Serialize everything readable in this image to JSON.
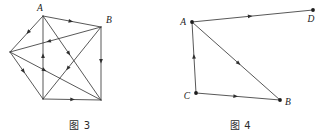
{
  "page": {
    "background_color": "#ffffff",
    "ink_color": "#3a3a3a",
    "node_color": "#1d1d1d"
  },
  "figures": [
    {
      "id": "figure-3",
      "caption": "图 3",
      "description": "complete-graph-on-five-vertices-with-directed-edges",
      "nodes": [
        {
          "id": "A",
          "label": "A",
          "x": 43,
          "y": 16,
          "label_x": 40,
          "label_y": 11,
          "label_anchor": "middle",
          "show_dot": false
        },
        {
          "id": "B",
          "label": "B",
          "x": 101,
          "y": 27,
          "label_x": 106,
          "label_y": 23,
          "label_anchor": "start",
          "show_dot": false
        },
        {
          "id": "L",
          "label": "",
          "x": 10,
          "y": 52,
          "label_x": 6,
          "label_y": 50,
          "label_anchor": "end",
          "show_dot": false
        },
        {
          "id": "P",
          "label": "",
          "x": 43,
          "y": 99,
          "label_x": 40,
          "label_y": 110,
          "label_anchor": "middle",
          "show_dot": false
        },
        {
          "id": "Q",
          "label": "",
          "x": 101,
          "y": 100,
          "label_x": 106,
          "label_y": 108,
          "label_anchor": "start",
          "show_dot": false
        }
      ],
      "edges": [
        {
          "from": "A",
          "to": "B",
          "arrow_at": 0.52,
          "arrow_dir": "forward"
        },
        {
          "from": "A",
          "to": "L",
          "arrow_at": 0.5,
          "arrow_dir": "forward"
        },
        {
          "from": "A",
          "to": "Q",
          "arrow_at": 0.47,
          "arrow_dir": "forward"
        },
        {
          "from": "P",
          "to": "A",
          "arrow_at": 0.55,
          "arrow_dir": "forward"
        },
        {
          "from": "B",
          "to": "L",
          "arrow_at": 0.6,
          "arrow_dir": "forward"
        },
        {
          "from": "B",
          "to": "Q",
          "arrow_at": 0.5,
          "arrow_dir": "forward"
        },
        {
          "from": "B",
          "to": "P",
          "arrow_at": 0.6,
          "arrow_dir": "forward"
        },
        {
          "from": "L",
          "to": "P",
          "arrow_at": 0.45,
          "arrow_dir": "forward"
        },
        {
          "from": "L",
          "to": "Q",
          "arrow_at": 0.4,
          "arrow_dir": "forward"
        },
        {
          "from": "P",
          "to": "Q",
          "arrow_at": 0.55,
          "arrow_dir": "forward"
        }
      ]
    },
    {
      "id": "figure-4",
      "caption": "图 4",
      "description": "four-vertex-directed-graph-A-B-C-D",
      "nodes": [
        {
          "id": "A",
          "label": "A",
          "x": 32,
          "y": 22,
          "label_x": 26,
          "label_y": 25,
          "label_anchor": "end",
          "show_dot": true
        },
        {
          "id": "D",
          "label": "D",
          "x": 153,
          "y": 10,
          "label_x": 151,
          "label_y": 22,
          "label_anchor": "middle",
          "show_dot": true
        },
        {
          "id": "C",
          "label": "C",
          "x": 36,
          "y": 93,
          "label_x": 30,
          "label_y": 99,
          "label_anchor": "end",
          "show_dot": true
        },
        {
          "id": "B",
          "label": "B",
          "x": 120,
          "y": 100,
          "label_x": 125,
          "label_y": 105,
          "label_anchor": "start",
          "show_dot": true
        }
      ],
      "edges": [
        {
          "from": "A",
          "to": "D",
          "arrow_at": 0.5,
          "arrow_dir": "forward"
        },
        {
          "from": "A",
          "to": "B",
          "arrow_at": 0.55,
          "arrow_dir": "forward"
        },
        {
          "from": "C",
          "to": "A",
          "arrow_at": 0.55,
          "arrow_dir": "forward"
        },
        {
          "from": "C",
          "to": "B",
          "arrow_at": 0.5,
          "arrow_dir": "forward"
        }
      ]
    }
  ]
}
